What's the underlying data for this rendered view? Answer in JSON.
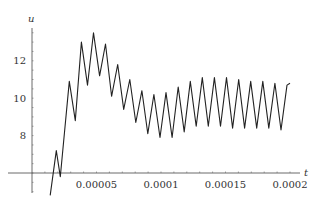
{
  "chart_data": {
    "type": "line",
    "title": "",
    "xlabel": "t",
    "ylabel": "u",
    "xlim": [
      0,
      0.0002
    ],
    "ylim": [
      5.3,
      13.8
    ],
    "x_axis_crosses_y_at": 6,
    "grid": false,
    "legend": null,
    "x_ticks": [
      {
        "value": 5e-05,
        "label": "0.00005"
      },
      {
        "value": 0.0001,
        "label": "0.0001"
      },
      {
        "value": 0.00015,
        "label": "0.00015"
      },
      {
        "value": 0.0002,
        "label": "0.0002"
      }
    ],
    "y_ticks": [
      {
        "value": 8,
        "label": "8"
      },
      {
        "value": 10,
        "label": "10"
      },
      {
        "value": 12,
        "label": "12"
      }
    ],
    "series": [
      {
        "name": "u(t)",
        "color": "#222222",
        "x": [
          1.41e-05,
          1.88e-05,
          2.19e-05,
          2.89e-05,
          3.36e-05,
          3.83e-05,
          4.3e-05,
          4.77e-05,
          5.24e-05,
          5.7e-05,
          6.17e-05,
          6.64e-05,
          7.11e-05,
          7.58e-05,
          8.05e-05,
          8.52e-05,
          8.98e-05,
          9.45e-05,
          9.92e-05,
          0.0001039,
          0.0001086,
          0.0001133,
          0.000118,
          0.0001227,
          0.0001273,
          0.000132,
          0.0001367,
          0.0001414,
          0.0001461,
          0.0001508,
          0.0001555,
          0.0001602,
          0.0001648,
          0.0001695,
          0.0001742,
          0.0001789,
          0.0001836,
          0.0001883,
          0.000193,
          0.0001977,
          0.0002
        ],
        "y": [
          4.8,
          7.2,
          5.8,
          10.9,
          8.8,
          13.0,
          10.7,
          13.5,
          11.2,
          12.9,
          10.1,
          11.8,
          9.4,
          11.0,
          8.7,
          10.4,
          8.1,
          10.2,
          7.9,
          10.3,
          7.9,
          10.6,
          8.2,
          10.9,
          8.5,
          11.1,
          8.5,
          11.1,
          8.5,
          11.1,
          8.4,
          11.0,
          8.4,
          10.9,
          8.4,
          10.9,
          8.4,
          10.8,
          8.3,
          10.7,
          10.8
        ]
      }
    ]
  }
}
